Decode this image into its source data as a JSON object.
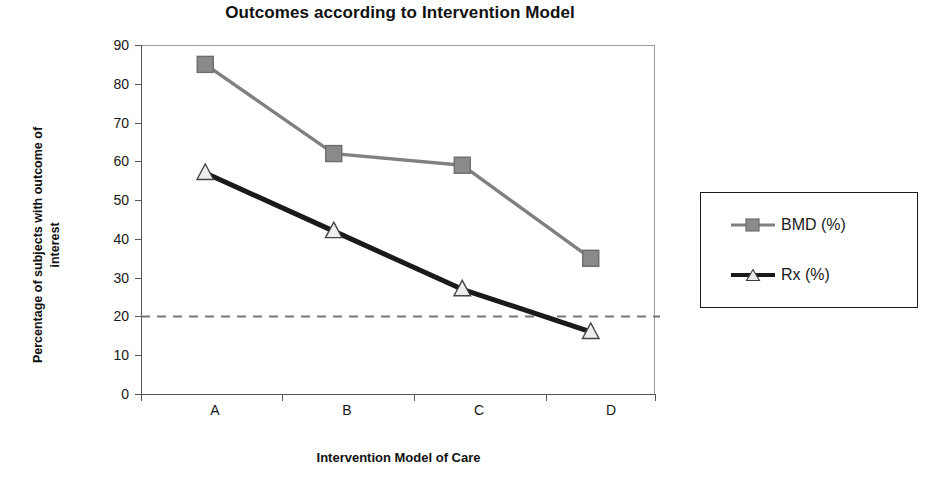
{
  "chart_data": {
    "type": "line",
    "title": "Outcomes according to Intervention Model",
    "xlabel": "Intervention Model of Care",
    "ylabel_line1": "Percentage of subjects with outcome of",
    "ylabel_line2": "interest",
    "categories": [
      "A",
      "B",
      "C",
      "D"
    ],
    "series": [
      {
        "name": "BMD (%)",
        "values": [
          85,
          62,
          59,
          35
        ],
        "color": "#808080",
        "marker": "square"
      },
      {
        "name": "Rx (%)",
        "values": [
          57,
          42,
          27,
          16
        ],
        "color": "#1a1a1a",
        "marker": "triangle"
      }
    ],
    "yticks": [
      90,
      80,
      70,
      60,
      50,
      40,
      30,
      20,
      10,
      0
    ],
    "ylim": [
      0,
      90
    ],
    "grid": false,
    "legend_position": "right",
    "reference_line": {
      "value": 20,
      "style": "dashed",
      "color": "#777777"
    }
  },
  "legend": {
    "items": [
      {
        "label": "BMD (%)"
      },
      {
        "label": "Rx (%)"
      }
    ]
  }
}
